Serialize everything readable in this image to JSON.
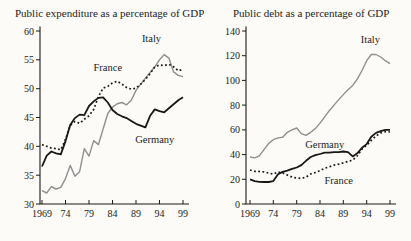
{
  "figure": {
    "background": "#fcfbf8",
    "text_color": "#1b1b1b",
    "axis_color": "#1b1b1b"
  },
  "chart_data": [
    {
      "type": "line",
      "title": "Public expenditure as a percentage of GDP",
      "years": [
        1969,
        1970,
        1971,
        1972,
        1973,
        1974,
        1975,
        1976,
        1977,
        1978,
        1979,
        1980,
        1981,
        1982,
        1983,
        1984,
        1985,
        1986,
        1987,
        1988,
        1989,
        1990,
        1991,
        1992,
        1993,
        1994,
        1995,
        1996,
        1997,
        1998,
        1999
      ],
      "xtick_years": [
        1969,
        1974,
        1979,
        1984,
        1989,
        1994,
        1999
      ],
      "xtick_labels": [
        "1969",
        "74",
        "79",
        "84",
        "89",
        "94",
        "99"
      ],
      "ylim": [
        30,
        60
      ],
      "ytick_values": [
        60,
        55,
        50,
        45,
        40,
        35,
        30
      ],
      "ytick_labels": [
        "60",
        "55",
        "50",
        "45",
        "40",
        "35",
        "30"
      ],
      "grid": false,
      "legend": "inline-labels",
      "series": [
        {
          "name": "Italy",
          "color": "#8f8f8f",
          "line_style": "solid",
          "line_width": 1.4,
          "label_at": {
            "year": 1992.3,
            "value": 58.7
          },
          "values": [
            32.3,
            31.9,
            33.0,
            32.6,
            32.9,
            34.4,
            36.7,
            34.8,
            35.6,
            39.6,
            38.3,
            41.0,
            40.3,
            43.0,
            45.7,
            46.8,
            47.4,
            47.6,
            47.2,
            48.0,
            49.7,
            50.8,
            51.8,
            52.8,
            53.8,
            55.0,
            55.9,
            55.3,
            52.9,
            52.3,
            52.1
          ]
        },
        {
          "name": "France",
          "color": "#181818",
          "line_style": "dotted",
          "line_width": 1.7,
          "label_at": {
            "year": 1983,
            "value": 53.6
          },
          "values": [
            40.3,
            40.0,
            39.7,
            39.6,
            39.4,
            41.2,
            43.6,
            44.3,
            44.0,
            44.7,
            45.3,
            46.4,
            48.6,
            50.1,
            50.4,
            51.0,
            51.3,
            50.8,
            50.2,
            49.9,
            50.1,
            50.8,
            51.6,
            52.6,
            53.8,
            54.1,
            54.0,
            54.2,
            53.8,
            53.1,
            53.4
          ]
        },
        {
          "name": "Germany",
          "color": "#181818",
          "line_style": "solid",
          "line_width": 1.8,
          "label_at": {
            "year": 1993,
            "value": 41.2
          },
          "values": [
            36.5,
            38.4,
            39.1,
            38.8,
            38.6,
            40.9,
            43.7,
            44.9,
            45.5,
            45.4,
            47.0,
            47.8,
            48.4,
            48.5,
            47.6,
            46.3,
            45.6,
            45.2,
            44.9,
            44.4,
            43.9,
            43.6,
            43.3,
            45.3,
            46.4,
            46.1,
            45.9,
            46.6,
            47.3,
            48.0,
            48.5
          ]
        }
      ]
    },
    {
      "type": "line",
      "title": "Public debt as a percentage of GDP",
      "years": [
        1969,
        1970,
        1971,
        1972,
        1973,
        1974,
        1975,
        1976,
        1977,
        1978,
        1979,
        1980,
        1981,
        1982,
        1983,
        1984,
        1985,
        1986,
        1987,
        1988,
        1989,
        1990,
        1991,
        1992,
        1993,
        1994,
        1995,
        1996,
        1997,
        1998,
        1999
      ],
      "xtick_years": [
        1969,
        1974,
        1979,
        1984,
        1989,
        1994,
        1999
      ],
      "xtick_labels": [
        "1969",
        "74",
        "79",
        "84",
        "89",
        "94",
        "99"
      ],
      "ylim": [
        0,
        140
      ],
      "ytick_values": [
        140,
        120,
        100,
        80,
        60,
        40,
        20,
        0
      ],
      "ytick_labels": [
        "140",
        "120",
        "100",
        "80",
        "60",
        "40",
        "20",
        "0"
      ],
      "grid": false,
      "legend": "inline-labels",
      "series": [
        {
          "name": "Italy",
          "color": "#8f8f8f",
          "line_style": "solid",
          "line_width": 1.4,
          "label_at": {
            "year": 1994.8,
            "value": 133
          },
          "values": [
            38,
            37.3,
            39,
            44,
            49,
            52,
            53.5,
            54,
            58,
            60,
            61.5,
            57,
            55.5,
            58,
            61,
            65.5,
            70.5,
            75.5,
            80,
            84.5,
            88.5,
            92.5,
            96,
            101,
            108,
            116,
            121,
            121,
            119,
            116,
            113.5
          ]
        },
        {
          "name": "France",
          "color": "#181818",
          "line_style": "dotted",
          "line_width": 1.7,
          "label_at": {
            "year": 1988,
            "value": 19
          },
          "values": [
            27.5,
            26.5,
            26.3,
            26.0,
            25.0,
            24.2,
            25.8,
            25.2,
            23.5,
            21.8,
            21.0,
            20.7,
            21.8,
            24.3,
            25.5,
            27.0,
            29.0,
            30.0,
            31.5,
            32.3,
            33.3,
            34.5,
            35.5,
            39.0,
            44.5,
            47.5,
            51.5,
            55.0,
            57.5,
            58.5,
            58.3
          ]
        },
        {
          "name": "Germany",
          "color": "#181818",
          "line_style": "solid",
          "line_width": 1.8,
          "label_at": {
            "year": 1985,
            "value": 48
          },
          "values": [
            20,
            18.5,
            18,
            17.8,
            17.8,
            18.5,
            24,
            26,
            27,
            28.5,
            29.5,
            31.5,
            35,
            38,
            39.5,
            40.5,
            41.5,
            41.5,
            42,
            42,
            42.5,
            42,
            38.5,
            41,
            45.5,
            48.5,
            54.5,
            57.5,
            59,
            60,
            60
          ]
        }
      ]
    }
  ]
}
